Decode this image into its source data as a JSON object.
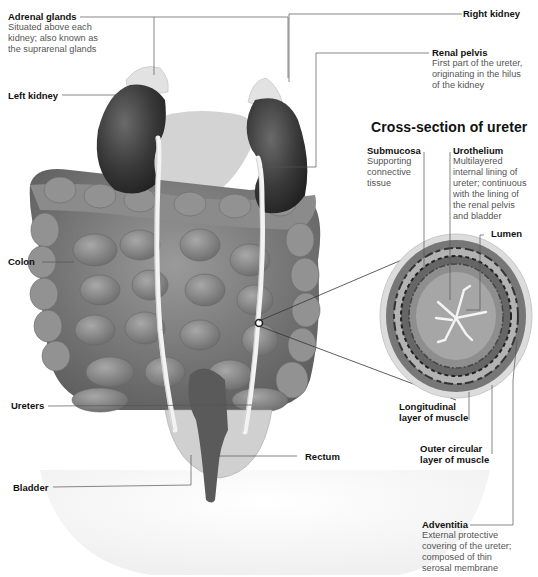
{
  "diagram": {
    "cross_section_title": "Cross-section of ureter",
    "labels": {
      "adrenal_glands": {
        "name": "Adrenal glands",
        "desc": [
          "Situated above each",
          "kidney; also known as",
          "the suprarenal glands"
        ]
      },
      "left_kidney": {
        "name": "Left kidney"
      },
      "right_kidney": {
        "name": "Right kidney"
      },
      "renal_pelvis": {
        "name": "Renal pelvis",
        "desc": [
          "First part of the ureter,",
          "originating in the hilus",
          "of the kidney"
        ]
      },
      "colon": {
        "name": "Colon"
      },
      "ureters": {
        "name": "Ureters"
      },
      "bladder": {
        "name": "Bladder"
      },
      "rectum": {
        "name": "Rectum"
      },
      "submucosa": {
        "name": "Submucosa",
        "desc": [
          "Supporting",
          "connective",
          "tissue"
        ]
      },
      "urothelium": {
        "name": "Urothelium",
        "desc": [
          "Multilayered",
          "internal lining of",
          "ureter; continuous",
          "with the lining of",
          "the renal pelvis",
          "and bladder"
        ]
      },
      "lumen": {
        "name": "Lumen"
      },
      "longitudinal_muscle": {
        "name": [
          "Longitudinal",
          "layer of muscle"
        ]
      },
      "outer_circular_muscle": {
        "name": [
          "Outer circular",
          "layer of muscle"
        ]
      },
      "adventitia": {
        "name": "Adventitia",
        "desc": [
          "External protective",
          "covering of the ureter;",
          "composed of thin",
          "serosal membrane"
        ]
      }
    },
    "colors": {
      "background": "#ffffff",
      "leader_line": "#555555",
      "kidney": "#3a3a3a",
      "intestine": "#7a7a7a",
      "adrenal": "#d8d8d8",
      "ureter": "#f2f2f2"
    }
  }
}
